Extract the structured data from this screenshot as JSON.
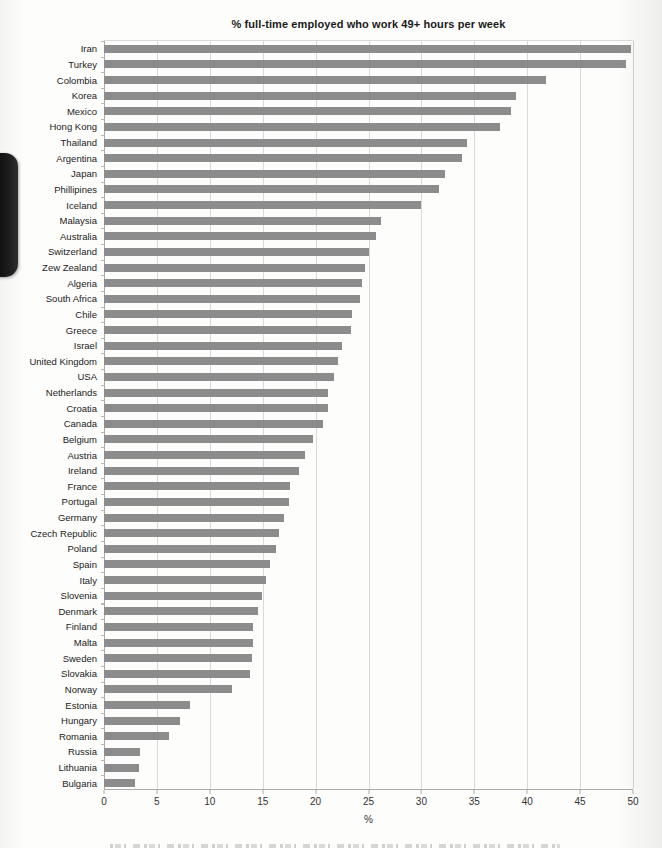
{
  "page": {
    "background": "#fdfdfc"
  },
  "edge_artifact": {
    "name": "black-page-edge-tab",
    "color": "#141414"
  },
  "chart_data": {
    "type": "bar",
    "orientation": "horizontal",
    "title": "% full-time employed who work 49+ hours per week",
    "xlabel": "%",
    "xlim": [
      0,
      50
    ],
    "xticks": [
      0,
      5,
      10,
      15,
      20,
      25,
      30,
      35,
      40,
      45,
      50
    ],
    "grid": true,
    "bar_color": "#8c8c8c",
    "categories": [
      "Iran",
      "Turkey",
      "Colombia",
      "Korea",
      "Mexico",
      "Hong Kong",
      "Thailand",
      "Argentina",
      "Japan",
      "Phillipines",
      "Iceland",
      "Malaysia",
      "Australia",
      "Switzerland",
      "Zew Zealand",
      "Algeria",
      "South Africa",
      "Chile",
      "Greece",
      "Israel",
      "United Kingdom",
      "USA",
      "Netherlands",
      "Croatia",
      "Canada",
      "Belgium",
      "Austria",
      "Ireland",
      "France",
      "Portugal",
      "Germany",
      "Czech Republic",
      "Poland",
      "Spain",
      "Italy",
      "Slovenia",
      "Denmark",
      "Finland",
      "Malta",
      "Sweden",
      "Slovakia",
      "Norway",
      "Estonia",
      "Hungary",
      "Romania",
      "Russia",
      "Lithuania",
      "Bulgaria"
    ],
    "values": [
      49.8,
      49.3,
      41.8,
      38.9,
      38.5,
      37.4,
      34.3,
      33.8,
      32.2,
      31.7,
      30.0,
      26.2,
      25.7,
      25.0,
      24.7,
      24.4,
      24.2,
      23.4,
      23.3,
      22.5,
      22.1,
      21.7,
      21.2,
      21.2,
      20.7,
      19.8,
      19.0,
      18.4,
      17.6,
      17.5,
      17.0,
      16.5,
      16.3,
      15.7,
      15.3,
      14.9,
      14.6,
      14.1,
      14.1,
      14.0,
      13.8,
      12.1,
      8.1,
      7.2,
      6.1,
      3.4,
      3.3,
      2.9
    ]
  }
}
